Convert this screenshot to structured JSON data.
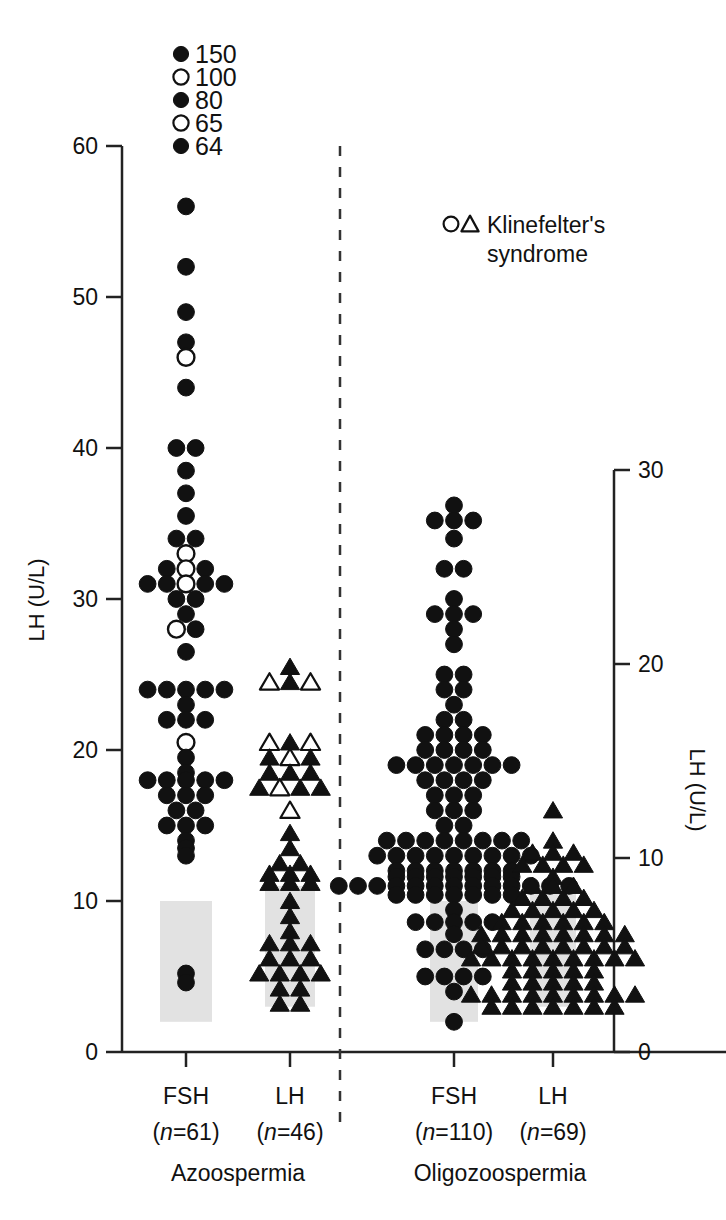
{
  "axes": {
    "left": {
      "title": "LH (U/L)",
      "ticks": [
        0,
        10,
        20,
        30,
        40,
        50,
        60
      ],
      "min": 0,
      "max": 60
    },
    "right": {
      "title": "LH (U/L)",
      "ticks": [
        0,
        10,
        20,
        30
      ],
      "min": 0,
      "max": 30
    }
  },
  "legend": {
    "klinefelter_label_line1": "Klinefelter's",
    "klinefelter_label_line2": "syndrome",
    "open_circle_marker": "open-circle",
    "open_triangle_marker": "open-triangle"
  },
  "offscale": {
    "caption_values": [
      "150",
      "100",
      "80",
      "65",
      "64"
    ],
    "markers": [
      "filled-circle",
      "open-circle",
      "filled-circle",
      "open-circle",
      "filled-circle"
    ]
  },
  "conditions": [
    {
      "name": "Azoospermia"
    },
    {
      "name": "Oligozoospermia"
    }
  ],
  "groups": [
    {
      "id": "azoo-fsh",
      "label": "FSH",
      "n_prefix": "(",
      "n_italic": "n",
      "n_value": "=61)",
      "condition": "Azoospermia"
    },
    {
      "id": "azoo-lh",
      "label": "LH",
      "n_prefix": "(",
      "n_italic": "n",
      "n_value": "=46)",
      "condition": "Azoospermia"
    },
    {
      "id": "oligo-fsh",
      "label": "FSH",
      "n_prefix": "(",
      "n_italic": "n",
      "n_value": "=110)",
      "condition": "Oligozoospermia"
    },
    {
      "id": "oligo-lh",
      "label": "LH",
      "n_prefix": "(",
      "n_italic": "n",
      "n_value": "=69)",
      "condition": "Oligozoospermia"
    }
  ],
  "colors": {
    "marker_fill": "#111111",
    "marker_open": "#ffffff",
    "axis": "#222222",
    "reference_band": "#e2e2e2",
    "divider": "#333333"
  },
  "chart_data": {
    "type": "scatter",
    "title": "",
    "xlabel": "",
    "ylabel": "LH (U/L)",
    "ylim": [
      0,
      60
    ],
    "ylim_right": [
      0,
      30
    ],
    "grid": false,
    "legend_position": "top-right",
    "marker_semantics": {
      "filled-circle": "FSH value, non-Klinefelter",
      "open-circle": "FSH value, Klinefelter's syndrome",
      "filled-triangle": "LH value, non-Klinefelter",
      "open-triangle": "LH value, Klinefelter's syndrome"
    },
    "offscale_values": [
      150,
      100,
      80,
      65,
      64
    ],
    "reference_bands": [
      {
        "group": "azoo-fsh",
        "low": 2,
        "high": 10
      },
      {
        "group": "azoo-lh",
        "low": 3,
        "high": 11
      },
      {
        "group": "oligo-fsh",
        "low": 2,
        "high": 10
      },
      {
        "group": "oligo-lh",
        "low": 3,
        "high": 11
      }
    ],
    "series": [
      {
        "name": "Azoospermia FSH",
        "group": "azoo-fsh",
        "axis": "left",
        "marker": "circle",
        "n": 61,
        "rows": [
          {
            "value": 56,
            "filled": 1,
            "open": 0
          },
          {
            "value": 52,
            "filled": 1,
            "open": 0
          },
          {
            "value": 49,
            "filled": 1,
            "open": 0
          },
          {
            "value": 47,
            "filled": 1,
            "open": 0
          },
          {
            "value": 46,
            "filled": 0,
            "open": 1
          },
          {
            "value": 44,
            "filled": 1,
            "open": 0
          },
          {
            "value": 40,
            "filled": 2,
            "open": 0
          },
          {
            "value": 38.5,
            "filled": 1,
            "open": 0
          },
          {
            "value": 37,
            "filled": 1,
            "open": 0
          },
          {
            "value": 35.5,
            "filled": 1,
            "open": 0
          },
          {
            "value": 34,
            "filled": 2,
            "open": 0
          },
          {
            "value": 33,
            "filled": 0,
            "open": 1
          },
          {
            "value": 32,
            "filled": 2,
            "open": 1
          },
          {
            "value": 31,
            "filled": 4,
            "open": 1
          },
          {
            "value": 30,
            "filled": 2,
            "open": 0
          },
          {
            "value": 29,
            "filled": 1,
            "open": 0
          },
          {
            "value": 28,
            "filled": 1,
            "open": 1
          },
          {
            "value": 26.5,
            "filled": 1,
            "open": 0
          },
          {
            "value": 24,
            "filled": 5,
            "open": 0
          },
          {
            "value": 23,
            "filled": 1,
            "open": 0
          },
          {
            "value": 22,
            "filled": 3,
            "open": 0
          },
          {
            "value": 20.5,
            "filled": 0,
            "open": 1
          },
          {
            "value": 19.5,
            "filled": 1,
            "open": 0
          },
          {
            "value": 18.5,
            "filled": 1,
            "open": 0
          },
          {
            "value": 18,
            "filled": 5,
            "open": 0
          },
          {
            "value": 17,
            "filled": 3,
            "open": 0
          },
          {
            "value": 16,
            "filled": 2,
            "open": 0
          },
          {
            "value": 15,
            "filled": 3,
            "open": 0
          },
          {
            "value": 14,
            "filled": 1,
            "open": 0
          },
          {
            "value": 13.5,
            "filled": 1,
            "open": 0
          },
          {
            "value": 13,
            "filled": 1,
            "open": 0
          },
          {
            "value": 5.2,
            "filled": 1,
            "open": 0
          },
          {
            "value": 4.6,
            "filled": 1,
            "open": 0
          }
        ]
      },
      {
        "name": "Azoospermia LH",
        "group": "azoo-lh",
        "axis": "left",
        "marker": "triangle",
        "n": 46,
        "rows": [
          {
            "value": 25.5,
            "filled": 1,
            "open": 0
          },
          {
            "value": 24.5,
            "filled": 1,
            "open": 2
          },
          {
            "value": 20.5,
            "filled": 1,
            "open": 2
          },
          {
            "value": 19.5,
            "filled": 2,
            "open": 1
          },
          {
            "value": 18.5,
            "filled": 3,
            "open": 0
          },
          {
            "value": 17.5,
            "filled": 3,
            "open": 1
          },
          {
            "value": 16,
            "filled": 0,
            "open": 1
          },
          {
            "value": 14.5,
            "filled": 1,
            "open": 0
          },
          {
            "value": 13.5,
            "filled": 1,
            "open": 0
          },
          {
            "value": 12.5,
            "filled": 2,
            "open": 0
          },
          {
            "value": 11.8,
            "filled": 3,
            "open": 0
          },
          {
            "value": 11.2,
            "filled": 3,
            "open": 0
          },
          {
            "value": 10,
            "filled": 1,
            "open": 0
          },
          {
            "value": 9,
            "filled": 1,
            "open": 0
          },
          {
            "value": 8,
            "filled": 1,
            "open": 0
          },
          {
            "value": 7.2,
            "filled": 3,
            "open": 0
          },
          {
            "value": 6.2,
            "filled": 3,
            "open": 0
          },
          {
            "value": 5.2,
            "filled": 4,
            "open": 0
          },
          {
            "value": 4.2,
            "filled": 2,
            "open": 0
          },
          {
            "value": 3.2,
            "filled": 2,
            "open": 0
          }
        ]
      },
      {
        "name": "Oligozoospermia FSH",
        "group": "oligo-fsh",
        "axis": "left",
        "marker": "circle",
        "n": 110,
        "rows": [
          {
            "value": 36.2,
            "filled": 1,
            "open": 0
          },
          {
            "value": 35.2,
            "filled": 3,
            "open": 0
          },
          {
            "value": 34,
            "filled": 1,
            "open": 0
          },
          {
            "value": 32,
            "filled": 2,
            "open": 0
          },
          {
            "value": 30,
            "filled": 1,
            "open": 0
          },
          {
            "value": 29,
            "filled": 3,
            "open": 0
          },
          {
            "value": 28,
            "filled": 1,
            "open": 0
          },
          {
            "value": 27,
            "filled": 1,
            "open": 0
          },
          {
            "value": 25,
            "filled": 2,
            "open": 0
          },
          {
            "value": 24,
            "filled": 2,
            "open": 0
          },
          {
            "value": 23,
            "filled": 1,
            "open": 0
          },
          {
            "value": 22,
            "filled": 2,
            "open": 0
          },
          {
            "value": 21,
            "filled": 4,
            "open": 0
          },
          {
            "value": 20,
            "filled": 4,
            "open": 0
          },
          {
            "value": 19,
            "filled": 7,
            "open": 0
          },
          {
            "value": 18,
            "filled": 4,
            "open": 0
          },
          {
            "value": 17,
            "filled": 3,
            "open": 0
          },
          {
            "value": 16,
            "filled": 3,
            "open": 0
          },
          {
            "value": 15,
            "filled": 2,
            "open": 0
          },
          {
            "value": 14,
            "filled": 8,
            "open": 0
          },
          {
            "value": 13,
            "filled": 9,
            "open": 0
          },
          {
            "value": 12,
            "filled": 7,
            "open": 0
          },
          {
            "value": 11.6,
            "filled": 7,
            "open": 0
          },
          {
            "value": 11,
            "filled": 13,
            "open": 0
          },
          {
            "value": 10.4,
            "filled": 7,
            "open": 0
          },
          {
            "value": 9.4,
            "filled": 1,
            "open": 0
          },
          {
            "value": 8.6,
            "filled": 5,
            "open": 0
          },
          {
            "value": 7.8,
            "filled": 1,
            "open": 0
          },
          {
            "value": 6.8,
            "filled": 4,
            "open": 0
          },
          {
            "value": 5,
            "filled": 4,
            "open": 0
          },
          {
            "value": 4,
            "filled": 1,
            "open": 0
          },
          {
            "value": 2,
            "filled": 1,
            "open": 0
          }
        ]
      },
      {
        "name": "Oligozoospermia LH",
        "group": "oligo-lh",
        "axis": "left",
        "marker": "triangle",
        "n": 69,
        "rows": [
          {
            "value": 16,
            "filled": 1,
            "open": 0
          },
          {
            "value": 14,
            "filled": 1,
            "open": 0
          },
          {
            "value": 13.2,
            "filled": 3,
            "open": 0
          },
          {
            "value": 12.4,
            "filled": 4,
            "open": 0
          },
          {
            "value": 11.6,
            "filled": 1,
            "open": 0
          },
          {
            "value": 11,
            "filled": 3,
            "open": 0
          },
          {
            "value": 10.2,
            "filled": 4,
            "open": 0
          },
          {
            "value": 9.4,
            "filled": 5,
            "open": 0
          },
          {
            "value": 8.6,
            "filled": 6,
            "open": 0
          },
          {
            "value": 7.8,
            "filled": 8,
            "open": 0
          },
          {
            "value": 7,
            "filled": 8,
            "open": 0
          },
          {
            "value": 6.2,
            "filled": 9,
            "open": 0
          },
          {
            "value": 5.4,
            "filled": 5,
            "open": 0
          },
          {
            "value": 4.6,
            "filled": 5,
            "open": 0
          },
          {
            "value": 3.8,
            "filled": 9,
            "open": 0
          },
          {
            "value": 3,
            "filled": 7,
            "open": 0
          }
        ]
      }
    ]
  }
}
